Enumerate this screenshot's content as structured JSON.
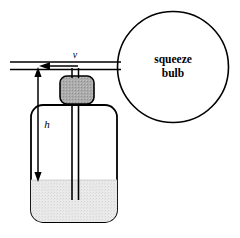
{
  "figure": {
    "background_color": "#ffffff",
    "stroke_color": "#000000"
  },
  "labels": {
    "bulb_line1": "squeeze",
    "bulb_line2": "bulb",
    "velocity": "v",
    "height": "h"
  },
  "parts": {
    "bulb": {
      "name": "squeeze bulb",
      "cx": 173,
      "cy": 67,
      "r": 55.5,
      "fill": "#ffffff",
      "stroke": "#000000",
      "stroke_width": 1.6
    },
    "bottle": {
      "name": "bottle",
      "x": 31,
      "y": 105,
      "width": 86,
      "height": 117,
      "corner_radius": 12,
      "fill": "#ffffff",
      "stroke": "#000000",
      "stroke_width": 1.8
    },
    "liquid": {
      "name": "liquid",
      "surface_y": 180,
      "fill": "#e9e9e9",
      "stroke": "none"
    },
    "stopper": {
      "name": "stopper",
      "x": 60,
      "y": 76,
      "width": 34,
      "height": 28,
      "corner_radius": 7,
      "fill": "#a9a9a9",
      "stroke": "#000000",
      "stroke_width": 1.6
    },
    "horizontal_tube": {
      "name": "horizontal tube",
      "x_start": 10,
      "x_end": 121,
      "y_top": 62,
      "y_bottom": 69.5,
      "stroke": "#000000",
      "stroke_width": 1.5
    },
    "riser_tube": {
      "name": "vertical riser tube",
      "x_left": 72,
      "x_right": 78.5,
      "y_top": 69.5,
      "y_bottom": 76,
      "stroke": "#000000",
      "stroke_width": 1.5
    },
    "dip_tube": {
      "name": "dip tube",
      "x_left": 72,
      "x_right": 78.5,
      "y_top": 104,
      "y_bottom": 200,
      "stroke": "#000000",
      "stroke_width": 1.6
    },
    "flow_arrow": {
      "name": "gas flow arrow",
      "direction": "left",
      "tip_x": 40,
      "tail_x": 78,
      "y": 66
    },
    "height_arrow": {
      "name": "height dimension arrow",
      "x": 38,
      "y_top": 68,
      "y_bottom": 181,
      "double_headed": true
    }
  }
}
